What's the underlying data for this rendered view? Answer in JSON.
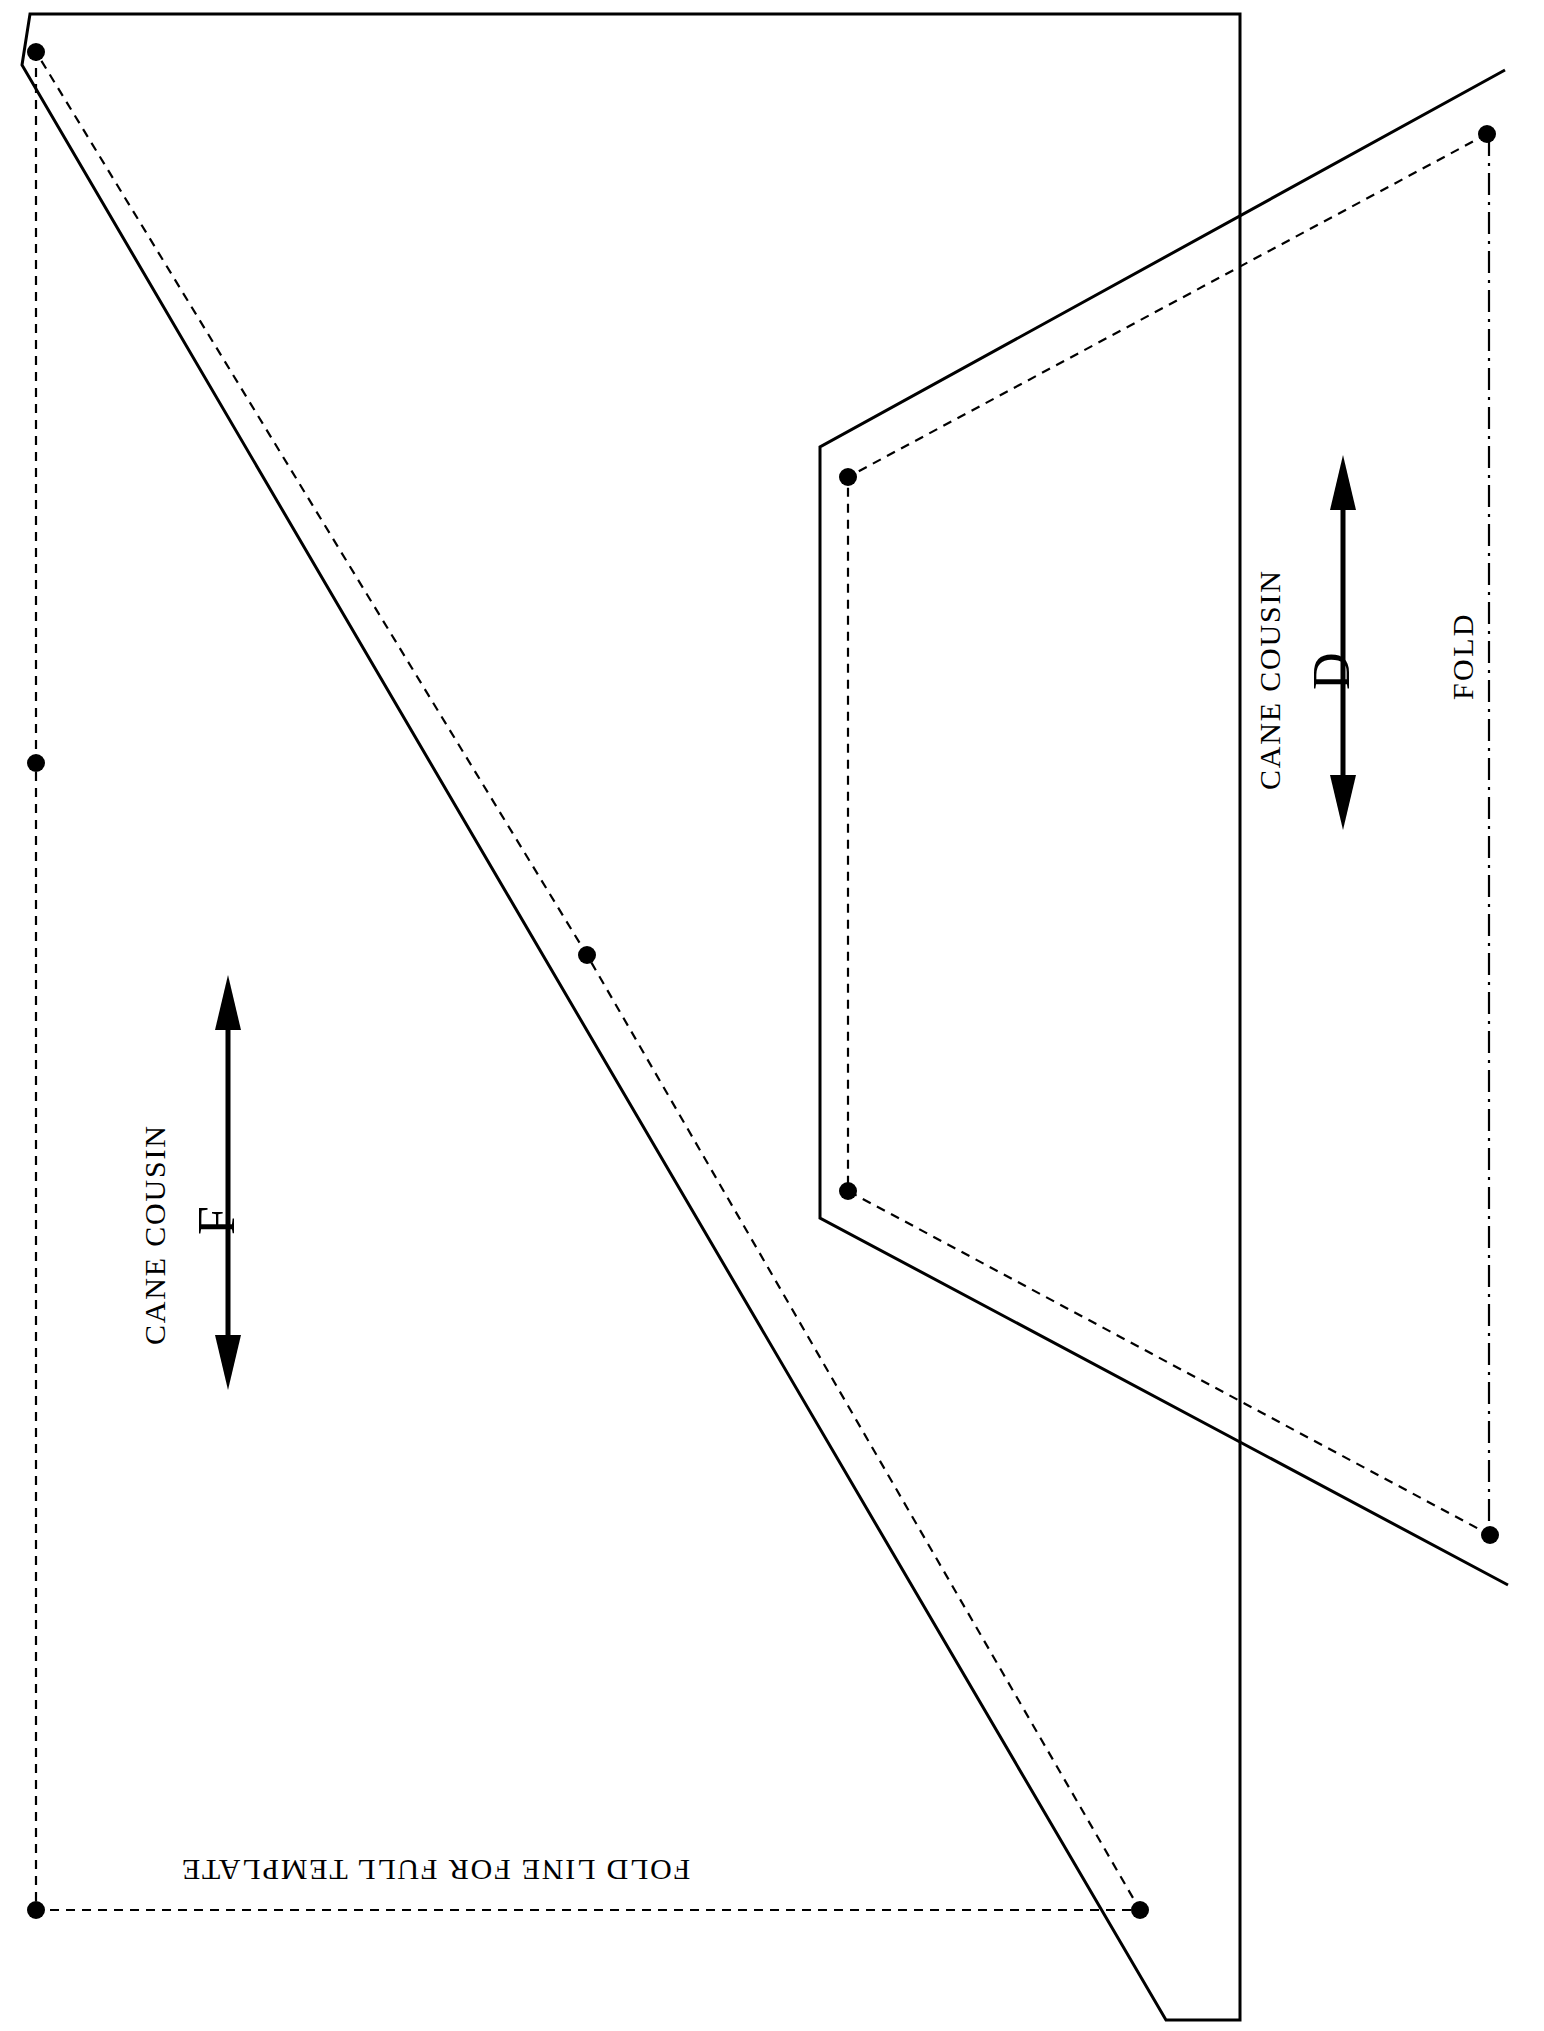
{
  "document": {
    "kind": "quilting-template-sheet",
    "background_color": "#ffffff",
    "ink_color": "#000000",
    "width": 1544,
    "height": 2031
  },
  "pieces": [
    {
      "id": "piece-f",
      "brand_line": "CANE COUSIN",
      "letter": "F",
      "grain_arrow": "double-headed-arrow",
      "cut_line_style": "solid",
      "sew_line_style": "dashed",
      "corner_markers": "dots",
      "fold_note": "FOLD LINE FOR FULL TEMPLATE"
    },
    {
      "id": "piece-d",
      "brand_line": "CANE COUSIN",
      "letter": "D",
      "grain_arrow": "double-headed-arrow",
      "cut_line_style": "solid",
      "sew_line_style": "dashed",
      "corner_markers": "dots",
      "fold_note": "FOLD"
    }
  ],
  "labels": {
    "piece_f_title": "CANE COUSIN",
    "piece_f_letter": "F",
    "piece_f_foldline": "FOLD LINE FOR FULL TEMPLATE",
    "piece_d_title": "CANE COUSIN",
    "piece_d_letter": "D",
    "piece_d_fold": "FOLD"
  },
  "geometry": {
    "piece_f": {
      "cut_outline": "38,22 1230,22 1230,1985 1165,1985 33,60",
      "sew_outline_points": [
        {
          "x": 36,
          "y": 52
        },
        {
          "x": 36,
          "y": 763
        },
        {
          "x": 36,
          "y": 1910
        },
        {
          "x": 1140,
          "y": 1910
        },
        {
          "x": 587,
          "y": 955
        }
      ],
      "dot_markers": [
        {
          "x": 36,
          "y": 52
        },
        {
          "x": 36,
          "y": 763
        },
        {
          "x": 36,
          "y": 1910
        },
        {
          "x": 1140,
          "y": 1910
        },
        {
          "x": 587,
          "y": 955
        }
      ]
    },
    "piece_d": {
      "dot_markers": [
        {
          "x": 1487,
          "y": 134
        },
        {
          "x": 848,
          "y": 477
        },
        {
          "x": 848,
          "y": 1191
        },
        {
          "x": 1490,
          "y": 1535
        }
      ]
    }
  },
  "colors": {
    "line": "#000000",
    "paper": "#ffffff"
  }
}
